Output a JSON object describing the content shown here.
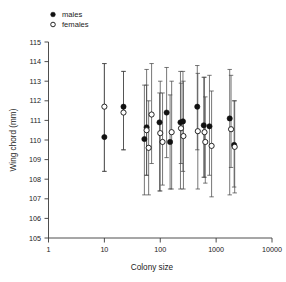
{
  "figure": {
    "width": 286,
    "height": 282,
    "background": "#ffffff"
  },
  "legend": {
    "position": "top-left",
    "entries": [
      {
        "key": "males",
        "label": "males",
        "marker": "filled-circle",
        "color": "#111111"
      },
      {
        "key": "females",
        "label": "females",
        "marker": "open-circle",
        "color": "#ffffff"
      }
    ]
  },
  "axes": {
    "x": {
      "title": "Colony size",
      "scale": "log10",
      "min": 1,
      "max": 10000,
      "ticks": [
        1,
        10,
        100,
        1000,
        10000
      ],
      "tick_labels": [
        "1",
        "10",
        "100",
        "1000",
        "10000"
      ]
    },
    "y": {
      "title": "Wing chord (mm)",
      "scale": "linear",
      "min": 105,
      "max": 115,
      "ticks": [
        105,
        106,
        107,
        108,
        109,
        110,
        111,
        112,
        113,
        114,
        115
      ],
      "tick_labels": [
        "105",
        "106",
        "107",
        "108",
        "109",
        "110",
        "111",
        "112",
        "113",
        "114",
        "115"
      ]
    }
  },
  "chart_data": {
    "type": "scatter",
    "title": "",
    "xlabel": "Colony size",
    "ylabel": "Wing chord (mm)",
    "xscale": "log",
    "xlim": [
      1,
      10000
    ],
    "ylim": [
      105,
      115
    ],
    "grid": false,
    "legend_position": "top-left",
    "error_bars": "vertical range bars with caps",
    "series": [
      {
        "name": "males",
        "marker": "filled-circle",
        "color": "#111111",
        "points": [
          {
            "x": 10,
            "y": 110.15,
            "ylow": 108.4,
            "yhigh": 113.9
          },
          {
            "x": 22,
            "y": 111.7,
            "ylow": 109.5,
            "yhigh": 113.5
          },
          {
            "x": 52,
            "y": 110.05,
            "ylow": 107.2,
            "yhigh": 112.8
          },
          {
            "x": 57,
            "y": 110.65,
            "ylow": 108.2,
            "yhigh": 113.6
          },
          {
            "x": 97,
            "y": 110.9,
            "ylow": 107.4,
            "yhigh": 112.4
          },
          {
            "x": 130,
            "y": 111.4,
            "ylow": 109.1,
            "yhigh": 113.7
          },
          {
            "x": 150,
            "y": 109.9,
            "ylow": 107.5,
            "yhigh": 112.3
          },
          {
            "x": 230,
            "y": 110.9,
            "ylow": 107.5,
            "yhigh": 113.5
          },
          {
            "x": 255,
            "y": 110.95,
            "ylow": 108.4,
            "yhigh": 113.5
          },
          {
            "x": 460,
            "y": 111.7,
            "ylow": 109.5,
            "yhigh": 113.8
          },
          {
            "x": 600,
            "y": 110.75,
            "ylow": 108.1,
            "yhigh": 113.2
          },
          {
            "x": 760,
            "y": 110.7,
            "ylow": 108.2,
            "yhigh": 113.3
          },
          {
            "x": 1750,
            "y": 111.1,
            "ylow": 107.2,
            "yhigh": 113.6
          },
          {
            "x": 2100,
            "y": 109.75,
            "ylow": 107.6,
            "yhigh": 112.0
          }
        ]
      },
      {
        "name": "females",
        "marker": "open-circle",
        "color": "#ffffff",
        "points": [
          {
            "x": 10,
            "y": 111.7,
            "ylow": 108.4,
            "yhigh": 113.9
          },
          {
            "x": 22,
            "y": 111.4,
            "ylow": 109.5,
            "yhigh": 113.5
          },
          {
            "x": 57,
            "y": 110.5,
            "ylow": 108.2,
            "yhigh": 112.8
          },
          {
            "x": 62,
            "y": 109.6,
            "ylow": 107.2,
            "yhigh": 112.0
          },
          {
            "x": 70,
            "y": 111.3,
            "ylow": 108.8,
            "yhigh": 113.9
          },
          {
            "x": 100,
            "y": 110.35,
            "ylow": 107.4,
            "yhigh": 113.0
          },
          {
            "x": 110,
            "y": 109.9,
            "ylow": 107.7,
            "yhigh": 112.4
          },
          {
            "x": 160,
            "y": 110.4,
            "ylow": 107.5,
            "yhigh": 113.0
          },
          {
            "x": 235,
            "y": 110.6,
            "ylow": 108.8,
            "yhigh": 112.9
          },
          {
            "x": 260,
            "y": 110.2,
            "ylow": 107.5,
            "yhigh": 113.0
          },
          {
            "x": 470,
            "y": 110.45,
            "ylow": 107.5,
            "yhigh": 113.4
          },
          {
            "x": 620,
            "y": 110.4,
            "ylow": 108.1,
            "yhigh": 113.2
          },
          {
            "x": 640,
            "y": 109.9,
            "ylow": 107.8,
            "yhigh": 112.2
          },
          {
            "x": 830,
            "y": 109.7,
            "ylow": 107.1,
            "yhigh": 112.5
          },
          {
            "x": 1850,
            "y": 110.55,
            "ylow": 108.6,
            "yhigh": 113.3
          },
          {
            "x": 2150,
            "y": 109.65,
            "ylow": 107.3,
            "yhigh": 112.0
          }
        ]
      }
    ]
  }
}
